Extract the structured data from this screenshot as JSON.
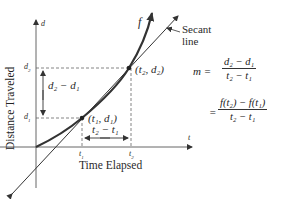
{
  "figure": {
    "axes": {
      "y_axis_label": "d",
      "x_axis_label": "t",
      "y_title": "Distance Traveled",
      "x_title": "Time Elapsed"
    },
    "ticks": {
      "d1": "d",
      "d1_sub": "1",
      "d2": "d",
      "d2_sub": "2",
      "t1": "t",
      "t1_sub": "1",
      "t2": "t",
      "t2_sub": "2"
    },
    "curve_label": "f",
    "secant_label_line1": "Secant",
    "secant_label_line2": "line",
    "points": {
      "p1": "(t₁, d₁)",
      "p2": "(t₂, d₂)"
    },
    "intervals": {
      "vertical": "d₂ − d₁",
      "horizontal": "t₂ − t₁"
    },
    "formula": {
      "lhs": "m =",
      "frac1_num": "d₂ − d₁",
      "frac1_den": "t₂ − t₁",
      "eq2": "=",
      "frac2_num": "f(t₂) − f(t₁)",
      "frac2_den": "t₂ − t₁"
    },
    "colors": {
      "curve": "#333333",
      "secant": "#333333",
      "axes": "#555555",
      "dashed": "#666666"
    }
  }
}
